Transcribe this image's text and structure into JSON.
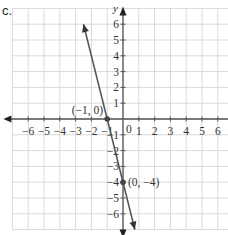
{
  "part_label": "c.",
  "chart_data": {
    "type": "line",
    "title": "",
    "xlabel": "x",
    "ylabel": "y",
    "xlim": [
      -7,
      7
    ],
    "ylim": [
      -7,
      7
    ],
    "grid": true,
    "x_ticks": [
      -6,
      -5,
      -4,
      -3,
      -2,
      -1,
      1,
      2,
      3,
      4,
      5,
      6
    ],
    "y_ticks": [
      -6,
      -5,
      -4,
      -3,
      -2,
      -1,
      1,
      2,
      3,
      4,
      5,
      6
    ],
    "x_tick_labels": [
      "−6",
      "−5",
      "−4",
      "−3",
      "−2",
      "−1",
      "1",
      "2",
      "3",
      "4",
      "5",
      "6"
    ],
    "y_tick_labels": [
      "−6",
      "−5",
      "−4",
      "−3",
      "−2",
      "−1",
      "1",
      "2",
      "3",
      "4",
      "5",
      "6"
    ],
    "origin_label": "0",
    "series": [
      {
        "name": "y = -4x - 4",
        "slope": -4,
        "intercept": -4,
        "x": [
          -2.5,
          0.75
        ],
        "y": [
          6,
          -7
        ],
        "color": "#555555"
      }
    ],
    "points": [
      {
        "x": -1,
        "y": 0,
        "label": "(−1, 0)"
      },
      {
        "x": 0,
        "y": -4,
        "label": "(0, −4)"
      }
    ],
    "colors": {
      "grid": "#d9d9d9",
      "axis": "#555555",
      "line": "#555555",
      "text": "#333333"
    }
  }
}
